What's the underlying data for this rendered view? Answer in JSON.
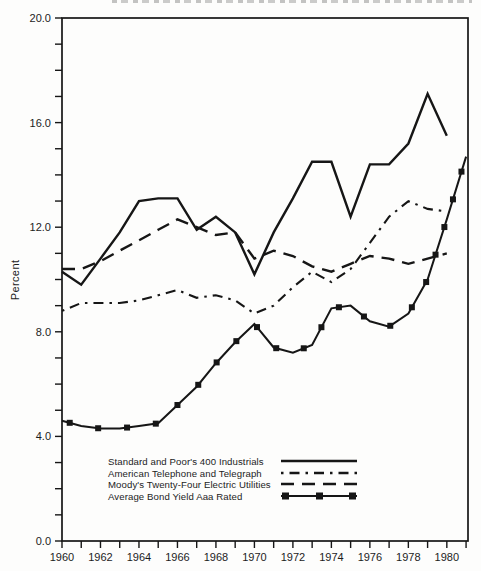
{
  "figure": {
    "y_axis_label": "Percent",
    "background": "#fdfdfc",
    "line_color": "#161616",
    "title_cut_off_at_top": true
  },
  "chart_data": {
    "type": "line",
    "title": "",
    "xlabel": "",
    "ylabel": "Percent",
    "ylim": [
      0,
      20
    ],
    "xlim": [
      1960,
      1981.1
    ],
    "grid": false,
    "y_major_tick_step": 4,
    "y_minor_tick_step": 1,
    "x_minor_tick_step": 1,
    "y_tick_labels": [
      "0.0",
      "4.0",
      "8.0",
      "12.0",
      "16.0",
      "20.0"
    ],
    "x_tick_labels": [
      "1960",
      "1962",
      "1964",
      "1966",
      "1968",
      "1970",
      "1972",
      "1974",
      "1976",
      "1978",
      "1980"
    ],
    "legend_position": "inside-bottom-left",
    "series": [
      {
        "name": "Standard and Poor's 400 Industrials",
        "slug": "sp400-industrials",
        "style": "solid",
        "x": [
          1960,
          1961,
          1962,
          1963,
          1964,
          1965,
          1966,
          1967,
          1968,
          1969,
          1970,
          1971,
          1972,
          1973,
          1974,
          1975,
          1976,
          1977,
          1978,
          1979,
          1980
        ],
        "values": [
          10.3,
          9.8,
          10.8,
          11.8,
          13.0,
          13.1,
          13.1,
          11.9,
          12.4,
          11.8,
          10.2,
          11.8,
          13.1,
          14.5,
          14.5,
          12.4,
          14.4,
          14.4,
          15.2,
          17.1,
          15.5
        ]
      },
      {
        "name": "American Telephone and Telegraph",
        "slug": "att",
        "style": "dashdot",
        "x": [
          1960,
          1961,
          1962,
          1963,
          1964,
          1965,
          1966,
          1967,
          1968,
          1969,
          1970,
          1971,
          1972,
          1973,
          1974,
          1975,
          1976,
          1977,
          1978,
          1979,
          1980
        ],
        "values": [
          8.8,
          9.1,
          9.1,
          9.1,
          9.2,
          9.4,
          9.6,
          9.3,
          9.4,
          9.2,
          8.7,
          9.0,
          9.7,
          10.3,
          9.9,
          10.4,
          11.4,
          12.4,
          13.0,
          12.7,
          12.6
        ]
      },
      {
        "name": "Moody's Twenty-Four Electric Utilities",
        "slug": "moodys-electric-utilities",
        "style": "dashed",
        "x": [
          1960,
          1961,
          1962,
          1963,
          1964,
          1965,
          1966,
          1967,
          1968,
          1969,
          1970,
          1971,
          1972,
          1973,
          1974,
          1975,
          1976,
          1977,
          1978,
          1979,
          1980
        ],
        "values": [
          10.4,
          10.4,
          10.7,
          11.1,
          11.5,
          11.9,
          12.3,
          12.0,
          11.7,
          11.8,
          10.8,
          11.1,
          10.9,
          10.5,
          10.3,
          10.6,
          10.9,
          10.8,
          10.6,
          10.8,
          11.0
        ]
      },
      {
        "name": "Average Bond Yield Aaa Rated",
        "slug": "aaa-bond-yield",
        "style": "solid-squares",
        "x": [
          1960,
          1961,
          1962,
          1963,
          1964,
          1965,
          1966,
          1967,
          1968,
          1969,
          1970,
          1971,
          1972,
          1973,
          1974,
          1975,
          1976,
          1977,
          1978,
          1979,
          1980,
          1981
        ],
        "values": [
          4.6,
          4.4,
          4.3,
          4.3,
          4.4,
          4.5,
          5.2,
          5.9,
          6.8,
          7.6,
          8.3,
          7.4,
          7.2,
          7.5,
          8.9,
          9.0,
          8.4,
          8.2,
          8.7,
          10.0,
          12.3,
          14.7
        ]
      }
    ]
  }
}
